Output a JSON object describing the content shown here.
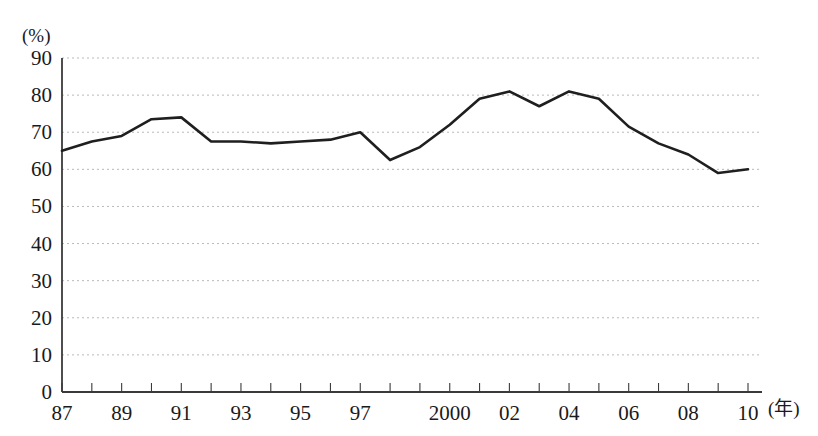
{
  "chart_data": {
    "type": "line",
    "title": "",
    "subtitle": "",
    "xlabel": "(年)",
    "ylabel": "(%)",
    "unit_label": "(%)",
    "x_caption": "(年)",
    "x": [
      1987,
      1988,
      1989,
      1990,
      1991,
      1992,
      1993,
      1994,
      1995,
      1996,
      1997,
      1998,
      1999,
      2000,
      2001,
      2002,
      2003,
      2004,
      2005,
      2006,
      2007,
      2008,
      2009,
      2010
    ],
    "categories": [
      "87",
      "88",
      "89",
      "90",
      "91",
      "92",
      "93",
      "94",
      "95",
      "96",
      "97",
      "98",
      "99",
      "2000",
      "01",
      "02",
      "03",
      "04",
      "05",
      "06",
      "07",
      "08",
      "09",
      "10"
    ],
    "values": [
      65,
      67.5,
      69,
      73.5,
      74,
      67.5,
      67.5,
      67,
      67.5,
      68,
      70,
      62.5,
      66,
      72,
      79,
      81,
      77,
      81,
      79,
      71.5,
      67,
      64,
      59,
      60
    ],
    "series": [
      {
        "name": "",
        "values": [
          65,
          67.5,
          69,
          73.5,
          74,
          67.5,
          67.5,
          67,
          67.5,
          68,
          70,
          62.5,
          66,
          72,
          79,
          81,
          77,
          81,
          79,
          71.5,
          67,
          64,
          59,
          60
        ],
        "color": "#1f1f1f"
      }
    ],
    "xtick_labels": [
      "87",
      "89",
      "91",
      "93",
      "95",
      "97",
      "2000",
      "02",
      "04",
      "06",
      "08",
      "10"
    ],
    "xtick_label_years": [
      1987,
      1989,
      1991,
      1993,
      1995,
      1997,
      2000,
      2002,
      2004,
      2006,
      2008,
      2010
    ],
    "ytick_labels": [
      "0",
      "10",
      "20",
      "30",
      "40",
      "50",
      "60",
      "70",
      "80",
      "90"
    ],
    "yticks": [
      0,
      10,
      20,
      30,
      40,
      50,
      60,
      70,
      80,
      90
    ],
    "ylim": [
      0,
      90
    ],
    "xlim": [
      1987,
      2010
    ],
    "grid": true,
    "grid_style": "dotted",
    "grid_color": "#b9b9b9",
    "axis_color": "#3a3a3a",
    "line_color": "#1f1f1f",
    "line_width": 2.6,
    "legend": null,
    "legend_position": "none",
    "annotations": []
  },
  "geometry": {
    "plot_left": 62,
    "plot_right": 762,
    "plot_top": 58,
    "plot_bottom": 392,
    "point_spacing": 30.43,
    "unit_label_x": 22,
    "unit_label_y": 42,
    "x_caption_x": 768,
    "x_caption_y": 415
  }
}
